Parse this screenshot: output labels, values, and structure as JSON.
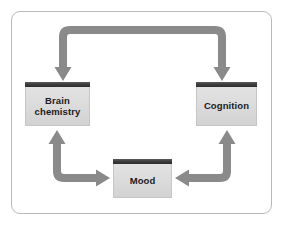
{
  "diagram": {
    "type": "cycle-diagram",
    "background_color": "#ffffff",
    "frame": {
      "border_color": "#b9b9b9",
      "corner_radius": 9
    },
    "node_style": {
      "header_bar_color": "#3b3b3b",
      "body_color": "#dcdcdc",
      "border_color": "#c6c6c6",
      "text_color": "#1b1b1b"
    },
    "arrow_style": {
      "color": "#8a8a8a",
      "thickness": 8
    },
    "nodes": [
      {
        "id": "brain-chemistry",
        "label": "Brain\nchemistry"
      },
      {
        "id": "cognition",
        "label": "Cognition"
      },
      {
        "id": "mood",
        "label": "Mood"
      }
    ],
    "connectors": [
      {
        "id": "brain-chemistry-cognition",
        "from": "brain-chemistry",
        "to": "cognition",
        "shape": "top-bracket",
        "direction": "bidirectional",
        "arrowheads": [
          "down-left",
          "down-right"
        ]
      },
      {
        "id": "brain-chemistry-mood",
        "from": "brain-chemistry",
        "to": "mood",
        "shape": "left-elbow",
        "direction": "bidirectional",
        "arrowheads": [
          "up",
          "right"
        ]
      },
      {
        "id": "cognition-mood",
        "from": "cognition",
        "to": "mood",
        "shape": "right-elbow",
        "direction": "bidirectional",
        "arrowheads": [
          "up",
          "left"
        ]
      }
    ]
  }
}
